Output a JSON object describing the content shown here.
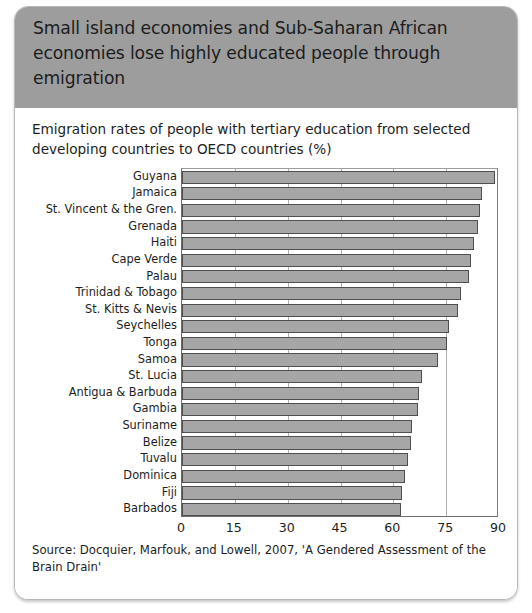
{
  "header": {
    "title": "Small island economies and Sub-Saharan African economies lose highly educated people through emigration",
    "background_color": "#9d9d9d"
  },
  "chart_data": {
    "type": "bar",
    "orientation": "horizontal",
    "title": "Emigration rates of people with tertiary education from selected developing countries to OECD countries (%)",
    "xlabel": "",
    "ylabel": "",
    "xlim": [
      0,
      90
    ],
    "xticks": [
      0,
      15,
      30,
      45,
      60,
      75,
      90
    ],
    "xtick_labels": [
      "0",
      "15",
      "30",
      "45",
      "60",
      "75",
      "90"
    ],
    "grid": true,
    "grid_axis": "x",
    "legend": false,
    "bar_color": "#a6a6a6",
    "bar_border_color": "#4f4f4f",
    "categories": [
      "Guyana",
      "Jamaica",
      "St. Vincent & the Gren.",
      "Grenada",
      "Haiti",
      "Cape Verde",
      "Palau",
      "Trinidad & Tobago",
      "St. Kitts & Nevis",
      "Seychelles",
      "Tonga",
      "Samoa",
      "St. Lucia",
      "Antigua & Barbuda",
      "Gambia",
      "Suriname",
      "Belize",
      "Tuvalu",
      "Dominica",
      "Fiji",
      "Barbados"
    ],
    "values": [
      89.0,
      85.1,
      84.5,
      84.0,
      83.0,
      82.0,
      81.5,
      79.3,
      78.5,
      75.8,
      75.2,
      72.8,
      68.0,
      67.3,
      67.0,
      65.2,
      65.0,
      64.2,
      63.3,
      62.6,
      62.3
    ]
  },
  "source": {
    "note": "Source: Docquier, Marfouk, and Lowell, 2007, 'A Gendered Assessment of the Brain Drain'"
  }
}
